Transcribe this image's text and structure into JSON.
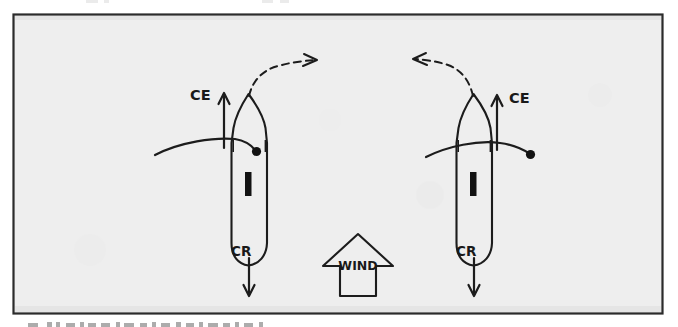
{
  "figure": {
    "frame": {
      "border_color": "#2b2b2b",
      "background_color": "#eeeeee",
      "x": 13,
      "y": 14,
      "width": 650,
      "height": 300
    },
    "ink_color": "#1c1c1c",
    "page_background": "#ffffff"
  },
  "wind_indicator": {
    "label": "WIND",
    "direction": "up",
    "description": "block arrow pointing upward between the two boats"
  },
  "boats": [
    {
      "id": "boat-left",
      "name": "lee-helm-boat",
      "ce_label": "CE",
      "cr_label": "CR",
      "ce_arrow_direction": "up",
      "cr_arrow_direction": "down",
      "ce_label_side": "left",
      "turn_arrow_direction": "right",
      "turn_arrow_style": "dashed-curved",
      "boom_side": "right",
      "centerboard": "vertical-bar"
    },
    {
      "id": "boat-right",
      "name": "weather-helm-boat",
      "ce_label": "CE",
      "cr_label": "CR",
      "ce_arrow_direction": "up",
      "cr_arrow_direction": "down",
      "ce_label_side": "right",
      "turn_arrow_direction": "left",
      "turn_arrow_style": "dashed-curved",
      "boom_side": "right",
      "centerboard": "vertical-bar"
    }
  ],
  "captions": {
    "top_clipped": "",
    "bottom_clipped": ""
  }
}
